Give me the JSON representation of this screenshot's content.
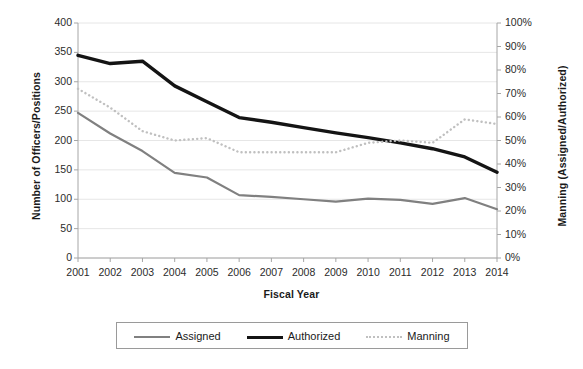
{
  "chart_data": {
    "type": "line",
    "title": "",
    "xlabel": "Fiscal Year",
    "ylabel": "Number of Officers/Positions",
    "y2label": "Manning (Assigned/Authorized)",
    "grid": true,
    "legend_position": "bottom",
    "categories": [
      "2001",
      "2002",
      "2003",
      "2004",
      "2005",
      "2006",
      "2007",
      "2008",
      "2009",
      "2010",
      "2011",
      "2012",
      "2013",
      "2014"
    ],
    "x": [
      2001,
      2002,
      2003,
      2004,
      2005,
      2006,
      2007,
      2008,
      2009,
      2010,
      2011,
      2012,
      2013,
      2014
    ],
    "ylim": [
      0,
      400
    ],
    "yticks": [
      0,
      50,
      100,
      150,
      200,
      250,
      300,
      350,
      400
    ],
    "ytick_labels": [
      "0",
      "50",
      "100",
      "150",
      "200",
      "250",
      "300",
      "350",
      "400"
    ],
    "y2lim": [
      0,
      100
    ],
    "y2ticks": [
      0,
      10,
      20,
      30,
      40,
      50,
      60,
      70,
      80,
      90,
      100
    ],
    "y2tick_labels": [
      "0%",
      "10%",
      "20%",
      "30%",
      "40%",
      "50%",
      "60%",
      "70%",
      "80%",
      "90%",
      "100%"
    ],
    "series": [
      {
        "name": "Assigned",
        "axis": "left",
        "style": "solid",
        "color": "#808080",
        "width": 2.2,
        "values": [
          247,
          212,
          182,
          145,
          137,
          107,
          104,
          100,
          96,
          101,
          99,
          92,
          102,
          83
        ]
      },
      {
        "name": "Authorized",
        "axis": "left",
        "style": "solid",
        "color": "#141414",
        "width": 3.4,
        "values": [
          345,
          331,
          335,
          293,
          266,
          239,
          231,
          222,
          213,
          205,
          196,
          186,
          172,
          146
        ]
      },
      {
        "name": "Manning",
        "axis": "right",
        "style": "dotted",
        "color": "#c0c0c0",
        "width": 2.4,
        "values": [
          72,
          64,
          54,
          50,
          51,
          45,
          45,
          45,
          45,
          49,
          50,
          49,
          59,
          57
        ]
      }
    ]
  },
  "axis_titles": {
    "y_left": "Number of Officers/Positions",
    "y_right": "Manning (Assigned/Authorized)",
    "x": "Fiscal Year"
  },
  "legend": {
    "items": [
      {
        "label": "Assigned"
      },
      {
        "label": "Authorized"
      },
      {
        "label": "Manning"
      }
    ]
  }
}
